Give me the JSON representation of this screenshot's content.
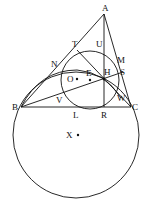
{
  "diagram": {
    "type": "geometry",
    "points": {
      "A": {
        "label": "A",
        "x": 104,
        "y": 14
      },
      "B": {
        "label": "B",
        "x": 21,
        "y": 107
      },
      "C": {
        "label": "C",
        "x": 131,
        "y": 107
      },
      "T": {
        "label": "T",
        "x": 77,
        "y": 50
      },
      "U": {
        "label": "U",
        "x": 104,
        "y": 46
      },
      "N": {
        "label": "N",
        "x": 58,
        "y": 68
      },
      "M": {
        "label": "M",
        "x": 119,
        "y": 61
      },
      "S": {
        "label": "S",
        "x": 121,
        "y": 72
      },
      "H": {
        "label": "H",
        "x": 104,
        "y": 79
      },
      "E": {
        "label": "E",
        "x": 90,
        "y": 80
      },
      "O": {
        "label": "O",
        "x": 77,
        "y": 79
      },
      "V": {
        "label": "V",
        "x": 60,
        "y": 96
      },
      "W": {
        "label": "W",
        "x": 121,
        "y": 98
      },
      "L": {
        "label": "L",
        "x": 76,
        "y": 107
      },
      "R": {
        "label": "R",
        "x": 104,
        "y": 107
      },
      "X": {
        "label": "X",
        "x": 76,
        "y": 135
      }
    },
    "labels": [
      "A",
      "B",
      "C",
      "T",
      "U",
      "N",
      "M",
      "S",
      "H",
      "E",
      "O",
      "V",
      "W",
      "L",
      "R",
      "X"
    ]
  }
}
